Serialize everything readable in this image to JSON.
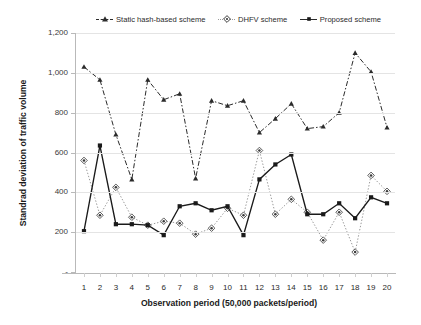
{
  "chart_data": {
    "type": "line",
    "title": "",
    "xlabel": "Observation period (50,000 packets/period)",
    "ylabel": "Standrad deviation of traffic volume",
    "categories": [
      1,
      2,
      3,
      4,
      5,
      6,
      7,
      8,
      9,
      10,
      11,
      12,
      13,
      14,
      15,
      16,
      17,
      18,
      19,
      20
    ],
    "x": [
      1,
      2,
      3,
      4,
      5,
      6,
      7,
      8,
      9,
      10,
      11,
      12,
      13,
      14,
      15,
      16,
      17,
      18,
      19,
      20
    ],
    "xlim": [
      1,
      20
    ],
    "ylim": [
      0,
      1200
    ],
    "yticks": [
      0,
      200,
      400,
      600,
      800,
      1000,
      1200
    ],
    "ytick_labels": [
      "-",
      "200",
      "400",
      "600",
      "800",
      "1,000",
      "1,200"
    ],
    "grid": true,
    "legend_position": "top",
    "series": [
      {
        "name": "Static hash-based scheme",
        "marker": "triangle",
        "linestyle": "dash-dot",
        "color": "#2b2b2b",
        "values": [
          1030,
          965,
          690,
          465,
          965,
          865,
          895,
          470,
          860,
          835,
          860,
          700,
          770,
          845,
          720,
          730,
          800,
          1100,
          1005,
          725
        ]
      },
      {
        "name": "DHFV scheme",
        "marker": "diamond",
        "linestyle": "dotted",
        "color": "#9a9a9a",
        "values": [
          560,
          285,
          425,
          275,
          235,
          255,
          245,
          190,
          220,
          320,
          285,
          610,
          290,
          365,
          300,
          160,
          300,
          100,
          485,
          405
        ]
      },
      {
        "name": "Proposed scheme",
        "marker": "square",
        "linestyle": "solid",
        "color": "#1a1a1a",
        "values": [
          205,
          635,
          240,
          240,
          235,
          185,
          330,
          345,
          310,
          330,
          185,
          465,
          540,
          590,
          290,
          290,
          345,
          270,
          375,
          345
        ]
      }
    ]
  },
  "legend": {
    "items": [
      {
        "label": "Static hash-based scheme",
        "marker": "triangle-marker-icon"
      },
      {
        "label": "DHFV scheme",
        "marker": "diamond-marker-icon"
      },
      {
        "label": "Proposed scheme",
        "marker": "square-marker-icon"
      }
    ]
  },
  "axes": {
    "x_title": "Observation period (50,000 packets/period)",
    "y_title": "Standrad deviation of traffic volume"
  }
}
